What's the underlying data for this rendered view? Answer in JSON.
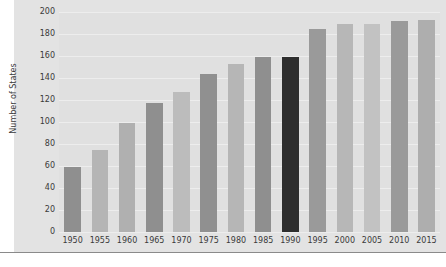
{
  "chart_data": {
    "type": "bar",
    "title": "",
    "subtitle": "",
    "xlabel": "",
    "ylabel": "Number of States",
    "categories": [
      "1950",
      "1955",
      "1960",
      "1965",
      "1970",
      "1975",
      "1980",
      "1985",
      "1990",
      "1995",
      "2000",
      "2005",
      "2010",
      "2015"
    ],
    "values": [
      59,
      75,
      99,
      117,
      127,
      144,
      153,
      159,
      159,
      185,
      189,
      189,
      192,
      193
    ],
    "series": [
      {
        "name": "Number of States",
        "values": [
          59,
          75,
          99,
          117,
          127,
          144,
          153,
          159,
          159,
          185,
          189,
          189,
          192,
          193
        ]
      }
    ],
    "bar_colors": [
      "#8f8f8f",
      "#b5b5b5",
      "#b0b0b0",
      "#8f8f8f",
      "#bcbcbc",
      "#909090",
      "#b6b6b6",
      "#8f8f8f",
      "#2e2e2e",
      "#9a9a9a",
      "#b7b7b7",
      "#c2c2c2",
      "#9a9a9a",
      "#aeaeae"
    ],
    "highlighted_category": "1990",
    "highlight_color": "#2e2e2e",
    "ylim": [
      0,
      200
    ],
    "ytick_values": [
      0,
      20,
      40,
      60,
      80,
      100,
      120,
      140,
      160,
      180,
      200
    ],
    "ytick_labels": [
      "0",
      "20",
      "40",
      "60",
      "80",
      "100",
      "120",
      "140",
      "160",
      "180",
      "200"
    ],
    "grid": true,
    "grid_orientation": "horizontal",
    "grid_color": "#ededed",
    "legend": false,
    "legend_position": "none",
    "plot_background": "#e0e0e0",
    "figure_background": "#e3e3e3",
    "page_background": "#ffffff",
    "tick_label_color": "#3a3a3a",
    "annotations": []
  }
}
